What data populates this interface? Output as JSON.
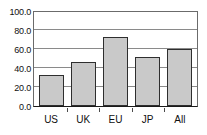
{
  "chart_data": {
    "type": "bar",
    "title": "",
    "subtitle": "",
    "xlabel": "",
    "ylabel": "",
    "categories": [
      "US",
      "UK",
      "EU",
      "JP",
      "All"
    ],
    "values": [
      33.0,
      46.0,
      72.5,
      51.5,
      60.5
    ],
    "ylim": [
      0.0,
      100.0
    ],
    "ytick_step": 20.0,
    "ytick_labels": [
      "100.0",
      "80.0",
      "60.0",
      "40.0",
      "20.0",
      "0.0"
    ],
    "ytick_values": [
      100.0,
      80.0,
      60.0,
      40.0,
      20.0,
      0.0
    ],
    "grid": true,
    "grid_axis": "y",
    "legend": false,
    "legend_position": "none",
    "series": [
      {
        "name": "",
        "values": [
          33.0,
          46.0,
          72.5,
          51.5,
          60.5
        ]
      }
    ],
    "colors": {
      "bar_fill": "#c9c9c9",
      "bar_border": "#2e2e2e",
      "gridline": "#8a8a8a",
      "frame": "#6b6b6b",
      "axis": "#1a1a1a",
      "text": "#101010",
      "background": "#ffffff"
    }
  }
}
